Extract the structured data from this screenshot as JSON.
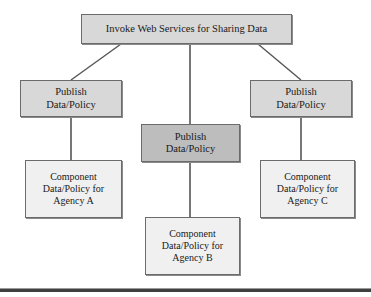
{
  "diagram": {
    "type": "tree",
    "title": "Invoke Web Services for Sharing Data",
    "colors": {
      "node_fill_light": "#d8d8d8",
      "node_fill_dark": "#bdbdbd",
      "node_fill_component": "#f0f0f0",
      "node_border": "#6b6b6b",
      "connector": "#555555",
      "rule": "#3f3f3f",
      "text": "#1a1a1a",
      "background": "#ffffff"
    },
    "nodes": {
      "root": {
        "label": "Invoke Web Services for Sharing Data",
        "x": 81,
        "y": 14,
        "w": 211,
        "h": 30
      },
      "publish_left": {
        "label": "Publish\nData/Policy",
        "x": 20,
        "y": 80,
        "w": 102,
        "h": 37
      },
      "publish_mid": {
        "label": "Publish\nData/Policy",
        "x": 141,
        "y": 124,
        "w": 99,
        "h": 38
      },
      "publish_right": {
        "label": "Publish\nData/Policy",
        "x": 250,
        "y": 80,
        "w": 102,
        "h": 37
      },
      "component_a": {
        "label": "Component\nData/Policy for\nAgency A",
        "x": 25,
        "y": 160,
        "w": 97,
        "h": 58
      },
      "component_b": {
        "label": "Component\nData/Policy for\nAgency B",
        "x": 145,
        "y": 217,
        "w": 95,
        "h": 58
      },
      "component_c": {
        "label": "Component\nData/Policy for\nAgency C",
        "x": 260,
        "y": 160,
        "w": 95,
        "h": 58
      }
    },
    "connectors": [
      {
        "name": "root-to-publish-left",
        "x1": 121,
        "y1": 44,
        "x2": 71,
        "y2": 80
      },
      {
        "name": "root-to-publish-mid",
        "x1": 190,
        "y1": 44,
        "x2": 190,
        "y2": 124
      },
      {
        "name": "root-to-publish-right",
        "x1": 258,
        "y1": 44,
        "x2": 301,
        "y2": 80
      },
      {
        "name": "publish-left-to-component-a",
        "x1": 71,
        "y1": 117,
        "x2": 71,
        "y2": 160
      },
      {
        "name": "publish-mid-to-component-b",
        "x1": 190,
        "y1": 162,
        "x2": 190,
        "y2": 217
      },
      {
        "name": "publish-right-to-component-c",
        "x1": 301,
        "y1": 117,
        "x2": 301,
        "y2": 160
      }
    ],
    "bottom_rule": {
      "y": 288
    }
  }
}
